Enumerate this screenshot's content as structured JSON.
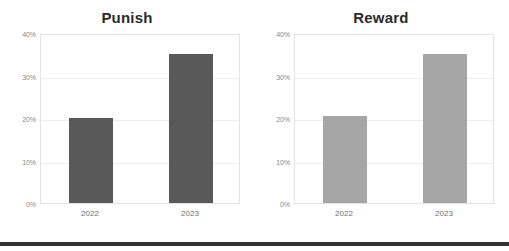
{
  "chart_data": [
    {
      "type": "bar",
      "title": "Punish",
      "categories": [
        "2022",
        "2023"
      ],
      "values": [
        20,
        35
      ],
      "series": [
        {
          "name": "Punish",
          "values": [
            20,
            35
          ]
        }
      ],
      "xlabel": "",
      "ylabel": "",
      "ylim": [
        0,
        40
      ],
      "yticks": [
        "0%",
        "10%",
        "20%",
        "30%",
        "40%"
      ],
      "ytick_values": [
        0,
        10,
        20,
        30,
        40
      ],
      "grid": true,
      "legend": false,
      "bar_color": "#595959"
    },
    {
      "type": "bar",
      "title": "Reward",
      "categories": [
        "2022",
        "2023"
      ],
      "values": [
        20.5,
        35
      ],
      "series": [
        {
          "name": "Reward",
          "values": [
            20.5,
            35
          ]
        }
      ],
      "xlabel": "",
      "ylabel": "",
      "ylim": [
        0,
        40
      ],
      "yticks": [
        "0%",
        "10%",
        "20%",
        "30%",
        "40%"
      ],
      "ytick_values": [
        0,
        10,
        20,
        30,
        40
      ],
      "grid": true,
      "legend": false,
      "bar_color": "#a6a6a6"
    }
  ],
  "colors": {
    "punish_bar": "#595959",
    "reward_bar": "#a6a6a6",
    "gridline": "#ededed",
    "plot_border": "#e3e3e3",
    "title_text": "#2b2b2b",
    "tick_text": "#888888",
    "category_text": "#6f6f6f",
    "divider": "#333333",
    "background": "#ffffff"
  }
}
